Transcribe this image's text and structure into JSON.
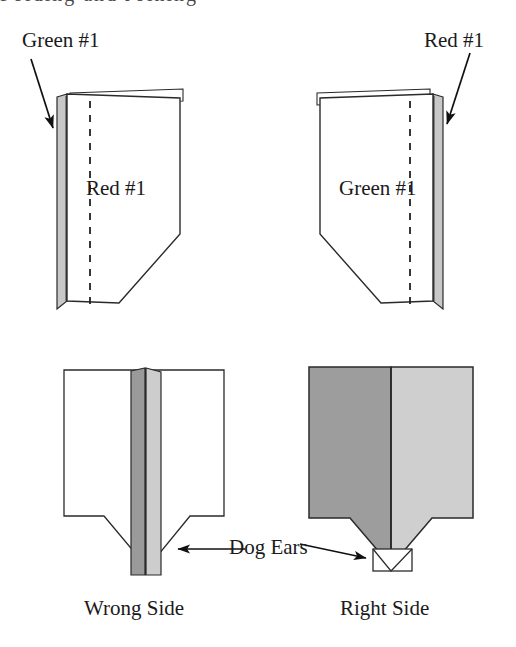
{
  "figure": {
    "title_fragment": "Folding and Joining",
    "width": 516,
    "height": 647,
    "background_color": "#ffffff",
    "ink_color": "#1a1a1a",
    "shading": {
      "dark_gray": "#999999",
      "mid_gray": "#b3b3b3",
      "light_gray": "#cccccc",
      "pale_gray": "#e0e0e0"
    }
  },
  "labels": {
    "green_callout": "Green #1",
    "red_callout": "Red #1",
    "red_inner": "Red #1",
    "green_inner": "Green #1",
    "dog_ears": "Dog Ears",
    "wrong_side": "Wrong Side",
    "right_side": "Right Side"
  },
  "panels": [
    {
      "id": "top-left",
      "name": "left-folded-piece",
      "description": "Folded fabric piece seen edge-on, fold on left, angled lower-right corner, dashed stitching line",
      "callout": "Green #1",
      "inner_label": "Red #1"
    },
    {
      "id": "top-right",
      "name": "right-folded-piece",
      "description": "Mirror image of left piece, fold on right, angled lower-left corner, dashed stitching line",
      "callout": "Red #1",
      "inner_label": "Green #1"
    },
    {
      "id": "bottom-left",
      "name": "wrong-side-view",
      "description": "Two pieces joined, seam allowance spine visible down the center, dog ears at bottom point",
      "caption": "Wrong Side",
      "annotation": "Dog Ears"
    },
    {
      "id": "bottom-right",
      "name": "right-side-view",
      "description": "Two pieces joined, shaded halves meeting at center seam, small dog ear tab at bottom point",
      "caption": "Right Side",
      "annotation": "Dog Ears"
    }
  ],
  "arrows": [
    {
      "name": "arrow-green-callout",
      "from": "Green #1 label",
      "to": "left piece fold edge",
      "direction": "down-right"
    },
    {
      "name": "arrow-red-callout",
      "from": "Red #1 label",
      "to": "right piece fold edge",
      "direction": "down-left"
    },
    {
      "name": "arrow-dogears-left",
      "from": "Dog Ears label",
      "to": "wrong side bottom point",
      "direction": "left"
    },
    {
      "name": "arrow-dogears-right",
      "from": "Dog Ears label",
      "to": "right side bottom tab",
      "direction": "right"
    }
  ]
}
